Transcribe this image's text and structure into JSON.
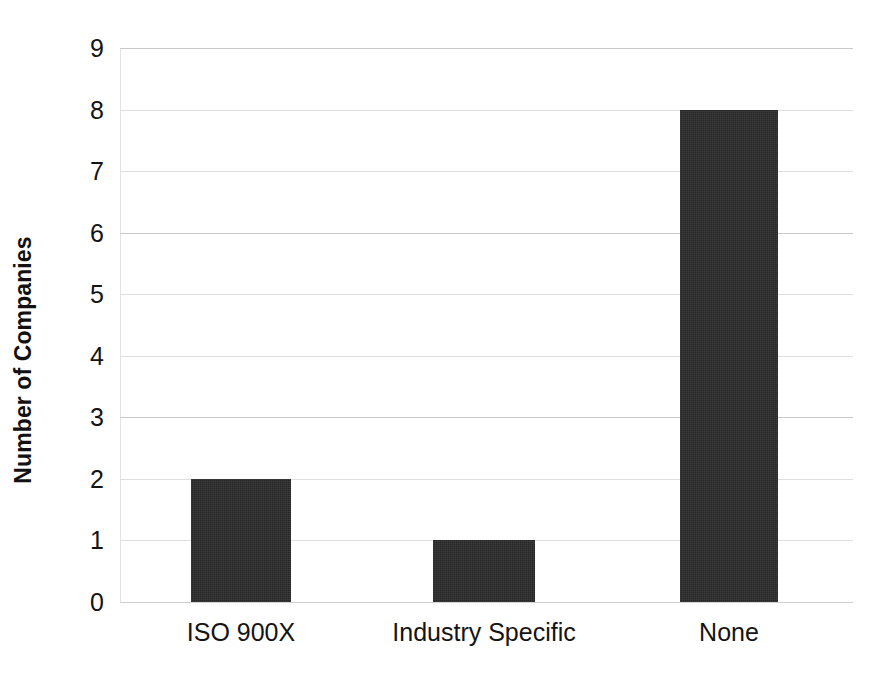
{
  "chart_data": {
    "type": "bar",
    "title": "",
    "subtitle": "",
    "xlabel": "",
    "ylabel": "Number of Companies",
    "categories": [
      "ISO 900X",
      "Industry Specific",
      "None"
    ],
    "values": [
      2,
      1,
      8
    ],
    "series": [
      {
        "name": "Number of Companies",
        "values": [
          2,
          1,
          8
        ]
      }
    ],
    "ylim": [
      0,
      9
    ],
    "ytick_labels": [
      "0",
      "1",
      "2",
      "3",
      "4",
      "5",
      "6",
      "7",
      "8",
      "9"
    ],
    "ytick_values": [
      0,
      1,
      2,
      3,
      4,
      5,
      6,
      7,
      8,
      9
    ],
    "y_tick_interval": 1,
    "grid": true,
    "grid_axis": "y",
    "legend": false,
    "legend_position": "none",
    "annotations": [],
    "bar_color": "#262626",
    "gridline_color": "#dedede",
    "background_color": "#ffffff",
    "axis_text_color": "#141414"
  },
  "axes": {
    "y_title": "Number of Companies",
    "y_ticks": [
      {
        "label": "9",
        "value": 9
      },
      {
        "label": "8",
        "value": 8
      },
      {
        "label": "7",
        "value": 7
      },
      {
        "label": "6",
        "value": 6
      },
      {
        "label": "5",
        "value": 5
      },
      {
        "label": "4",
        "value": 4
      },
      {
        "label": "3",
        "value": 3
      },
      {
        "label": "2",
        "value": 2
      },
      {
        "label": "1",
        "value": 1
      },
      {
        "label": "0",
        "value": 0
      }
    ],
    "x_ticks": [
      {
        "label": "ISO 900X",
        "value": 2
      },
      {
        "label": "Industry Specific",
        "value": 1
      },
      {
        "label": "None",
        "value": 8
      }
    ]
  }
}
